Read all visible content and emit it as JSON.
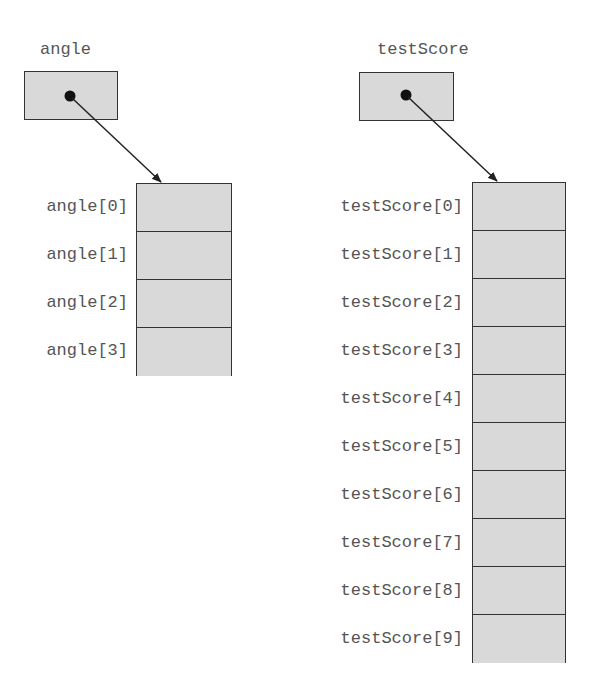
{
  "diagrams": [
    {
      "name": "angle",
      "elements": [
        "angle[0]",
        "angle[1]",
        "angle[2]",
        "angle[3]"
      ]
    },
    {
      "name": "testScore",
      "elements": [
        "testScore[0]",
        "testScore[1]",
        "testScore[2]",
        "testScore[3]",
        "testScore[4]",
        "testScore[5]",
        "testScore[6]",
        "testScore[7]",
        "testScore[8]",
        "testScore[9]"
      ]
    }
  ],
  "colors": {
    "cell_fill": "#d9d9d9",
    "stroke": "#333333",
    "label": "#555555"
  }
}
